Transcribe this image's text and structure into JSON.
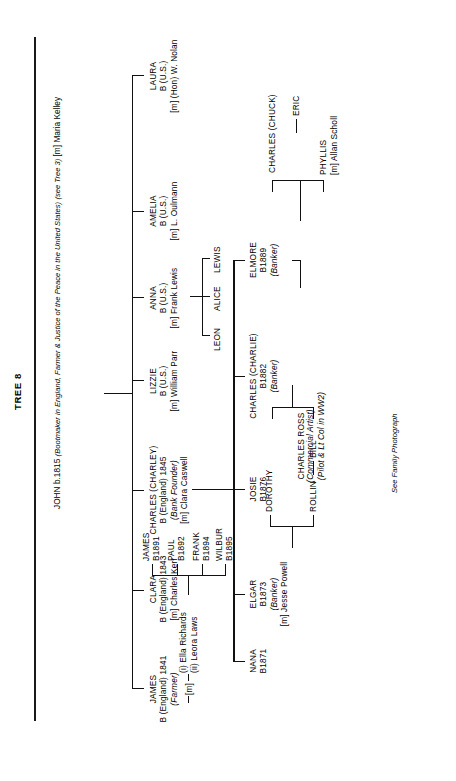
{
  "page": {
    "title": "TREE 8",
    "annotation": "See Family Photograph"
  },
  "tree": {
    "root": {
      "name": "JOHN",
      "birth": "b.1815",
      "occupation": "(Bootmaker in England, Farmer & Justice of the Peace in the United States)",
      "reference": "(see Tree 3)",
      "spouse": "[m] Maria Kelley"
    },
    "generation2": [
      {
        "id": "james",
        "name": "JAMES",
        "birth": "B (England) 1841",
        "occupation": "(Farmer)",
        "marriage_label": "[m]",
        "spouses": [
          "(i) Ella Richards",
          "(ii) Leora Laws"
        ]
      },
      {
        "id": "clara",
        "name": "CLARA",
        "birth": "B (England) 1843",
        "spouse": "[m] Charles Kerr"
      },
      {
        "id": "charley",
        "name": "CHARLES (CHARLEY)",
        "birth": "B (England) 1845",
        "occupation": "(Bank Founder)",
        "spouse": "[m] Clara Caswell"
      },
      {
        "id": "lizzie",
        "name": "LIZZIE",
        "birth": "B (U.S.)",
        "spouse": "[m] William Parr"
      },
      {
        "id": "anna",
        "name": "ANNA",
        "birth": "B (U.S.)",
        "spouse": "[m] Frank Lewis"
      },
      {
        "id": "amelia",
        "name": "AMELIA",
        "birth": "B (U.S.)",
        "spouse": "[m] L. Oulmann"
      },
      {
        "id": "laura",
        "name": "LAURA",
        "birth": "B (U.S.)",
        "spouse": "[m] (Hon) W. Nolan"
      }
    ],
    "james_children": [
      {
        "name": "JAMES",
        "birth": "B1891"
      },
      {
        "name": "PAUL",
        "birth": "B1892"
      },
      {
        "name": "FRANK",
        "birth": "B1894"
      },
      {
        "name": "WILBUR",
        "birth": "B1895"
      }
    ],
    "anna_children": [
      {
        "name": "LEON"
      },
      {
        "name": "ALICE"
      },
      {
        "name": "LEWIS"
      }
    ],
    "charley_children": [
      {
        "name": "NANA",
        "birth": "B1871"
      },
      {
        "name": "ELGAR",
        "birth": "B1873",
        "occupation": "(Banker)",
        "spouse": "[m] Jesse Powell"
      },
      {
        "name": "JOSIE",
        "birth": "B1876"
      },
      {
        "name": "CHARLES (CHARLIE)",
        "birth": "B1882",
        "occupation": "(Banker)"
      },
      {
        "name": "ELMORE",
        "birth": "B1889",
        "occupation": "(Banker)"
      }
    ],
    "elgar_children": [
      {
        "name": "ROLLIN"
      },
      {
        "name": "DOROTHY"
      }
    ],
    "rollin_children": [
      {
        "name": "BILL"
      }
    ],
    "charlie_children": [
      {
        "name": "CHARLES ROSS",
        "occupation": "(Commercial Artist)",
        "note": "(Pilot & Lt Col in WW2)"
      }
    ],
    "elmore_children": [
      {
        "name": "PHYLLIS",
        "spouse": "[m] Allan Scholl"
      },
      {
        "name": "CHARLES (CHUCK)"
      }
    ],
    "chuck_children": [
      {
        "name": "ERIC"
      }
    ]
  }
}
